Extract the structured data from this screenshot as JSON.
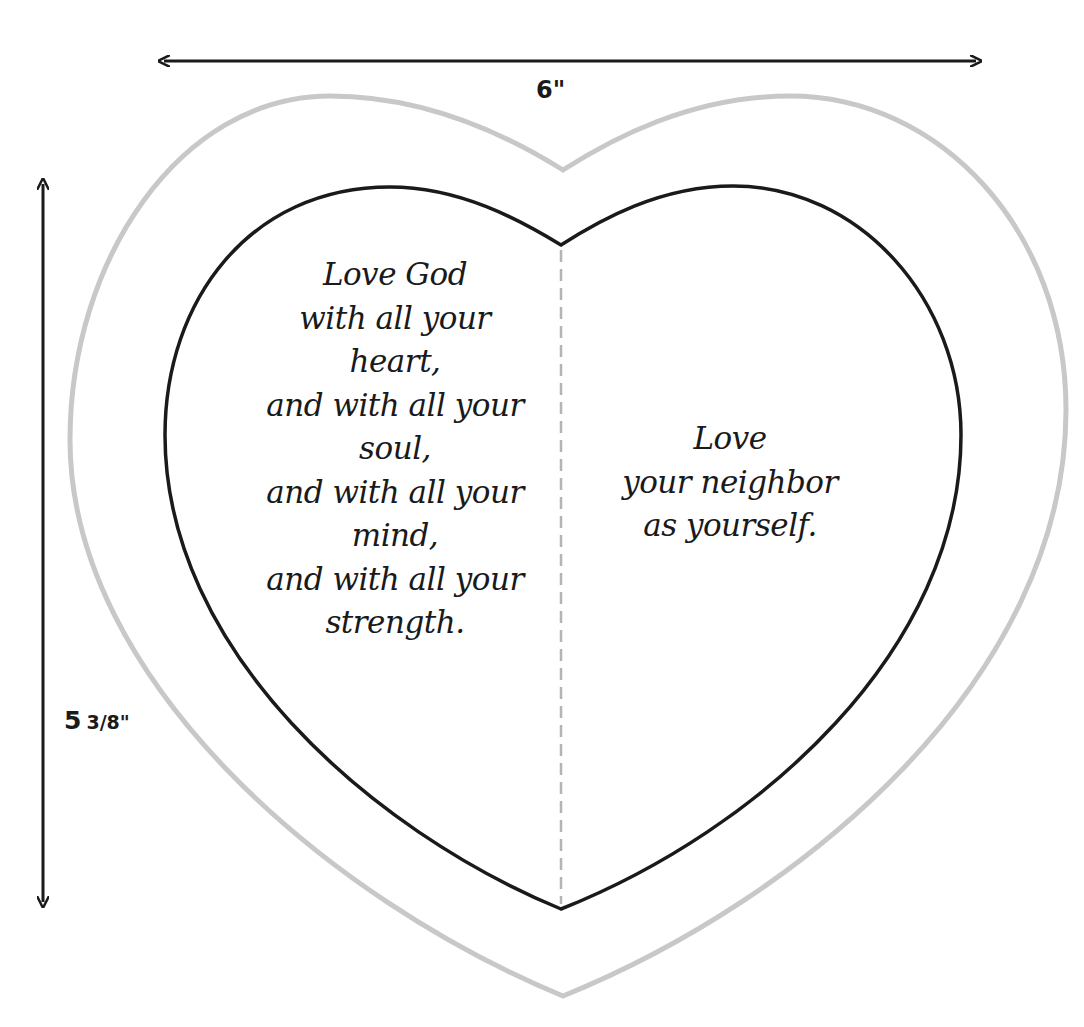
{
  "diagram": {
    "type": "heart-card-template",
    "colors": {
      "outer_outline": "#c8c8c8",
      "inner_outline": "#1a1a1a",
      "fold_line": "#b4b4b4",
      "arrow": "#1a1a1a",
      "text": "#1a1a1a",
      "background": "#ffffff"
    },
    "dimensions": {
      "width_label": "6\"",
      "height_label_whole": "5",
      "height_label_fraction": "3/8\""
    },
    "left_panel": {
      "lines": [
        "Love God",
        "with all your",
        "heart,",
        "and with all your",
        "soul,",
        "and with all your",
        "mind,",
        "and with all your",
        "strength."
      ]
    },
    "right_panel": {
      "lines": [
        "Love",
        "your neighbor",
        "as yourself."
      ]
    }
  }
}
